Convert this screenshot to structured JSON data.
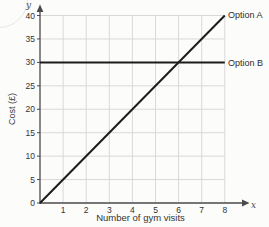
{
  "figure": {
    "background": "#fcfcfb"
  },
  "chart_data": {
    "type": "line",
    "title": "",
    "xlabel": "Number of gym visits",
    "ylabel": "Cost (£)",
    "x_axis_letter": "x",
    "y_axis_letter": "y",
    "xlim": [
      0,
      8
    ],
    "ylim": [
      0,
      40
    ],
    "xticks": [
      1,
      2,
      3,
      4,
      5,
      6,
      7,
      8
    ],
    "yticks": [
      0,
      5,
      10,
      15,
      20,
      25,
      30,
      35,
      40
    ],
    "grid": true,
    "legend_position": "line-end-right",
    "colors": {
      "line": "#1c1c1c",
      "grid": "#d9d9d9",
      "axis": "#4a4a4a",
      "text": "#333333"
    },
    "series": [
      {
        "name": "Option A",
        "x": [
          0,
          8
        ],
        "y": [
          0,
          40
        ]
      },
      {
        "name": "Option B",
        "x": [
          0,
          8
        ],
        "y": [
          30,
          30
        ]
      }
    ]
  }
}
